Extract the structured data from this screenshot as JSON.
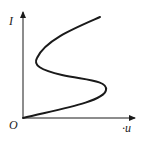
{
  "diagram": {
    "type": "I-u characteristic curve (S-shaped)",
    "axes": {
      "y_label": "I",
      "x_label": "·u",
      "origin_label": "O"
    },
    "colors": {
      "line": "#1a1a1a",
      "background": "#ffffff"
    },
    "curve_description": "S-shaped curve starting at origin, bulging right, folding back left, then rising to the upper right"
  }
}
